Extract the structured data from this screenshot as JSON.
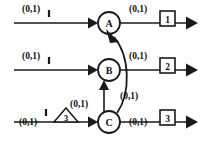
{
  "diagram": {
    "type": "flow-network",
    "title": "",
    "nodes": [
      {
        "id": "A",
        "label": "A",
        "cx": 109,
        "cy": 23,
        "r": 11
      },
      {
        "id": "B",
        "label": "B",
        "cx": 109,
        "cy": 70,
        "r": 11
      },
      {
        "id": "C",
        "label": "C",
        "cx": 109,
        "cy": 122,
        "r": 11
      }
    ],
    "input_edges": [
      {
        "id": "in-a",
        "label": "(0,1)",
        "tick": true,
        "target": "A"
      },
      {
        "id": "in-b",
        "label": "(0,1)",
        "tick": true,
        "target": "B"
      },
      {
        "id": "in-c",
        "label": "(0,1)",
        "tick": true,
        "target": "C"
      }
    ],
    "output_edges": [
      {
        "id": "out-a",
        "label": "(0,1)",
        "box": "1",
        "source": "A"
      },
      {
        "id": "out-b",
        "label": "(0,1)",
        "box": "2",
        "source": "B"
      },
      {
        "id": "out-c",
        "label": "(0,1)",
        "box": "3",
        "source": "C"
      }
    ],
    "internal_edges": [
      {
        "id": "c-to-b",
        "label": "(0,1)",
        "from": "C",
        "to": "B",
        "shape": "straight-vertical"
      },
      {
        "id": "c-to-a",
        "label": "(0,1)",
        "from": "C",
        "to": "A",
        "shape": "curved"
      }
    ],
    "shapes": [
      {
        "id": "triangle-3",
        "kind": "triangle",
        "label": "3"
      }
    ],
    "colors": {
      "stroke": "#1a1a1a",
      "text": "#111111",
      "background": "#ffffff"
    }
  }
}
